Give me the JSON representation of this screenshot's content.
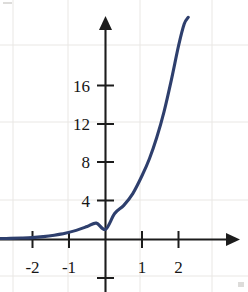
{
  "figure": {
    "kind": "cartesian-graph",
    "background_color": "#ffffff",
    "curve_color": "#2e3f6d",
    "axis_color": "#1c1c1c",
    "grid_color": "#e9e7e4"
  },
  "chart_data": {
    "type": "line",
    "title": "",
    "xlabel": "",
    "ylabel": "",
    "xlim": [
      -2.9,
      3.6
    ],
    "ylim": [
      -5.5,
      23.5
    ],
    "grid": true,
    "legend": null,
    "x_tick_labels": [
      "-2",
      "-1",
      "1",
      "2"
    ],
    "x_tick_values": [
      -2,
      -1,
      1,
      2
    ],
    "y_tick_labels": [
      "4",
      "8",
      "12",
      "16"
    ],
    "y_tick_values": [
      4,
      8,
      12,
      16
    ],
    "untitled_ticks": {
      "x_axis_extra": [],
      "y_axis_extra": [
        -4
      ]
    },
    "series": [
      {
        "name": "exponential-curve",
        "color": "#2e3f6d",
        "x": [
          -2.9,
          -2.6,
          -2.3,
          -2.0,
          -1.7,
          -1.4,
          -1.1,
          -0.8,
          -0.5,
          -0.25,
          0.0,
          0.25,
          0.5,
          0.75,
          1.0,
          1.2,
          1.4,
          1.6,
          1.8,
          2.0,
          2.15,
          2.26
        ],
        "y": [
          0.1,
          0.12,
          0.15,
          0.2,
          0.3,
          0.45,
          0.65,
          0.95,
          1.35,
          1.7,
          1.05,
          2.7,
          3.55,
          4.8,
          6.65,
          8.4,
          10.6,
          13.3,
          16.6,
          20.2,
          22.4,
          23.1
        ]
      }
    ]
  }
}
